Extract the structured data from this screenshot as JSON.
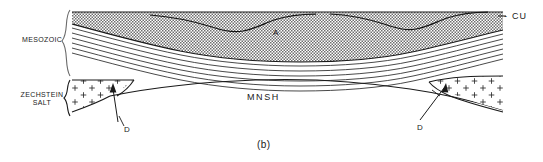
{
  "figure": {
    "caption": "(b)",
    "type": "geological-cross-section",
    "width": 543,
    "height": 162
  },
  "labels": {
    "mesozoic": "MESOZOIC",
    "zechstein_salt": "ZECHSTEIN\nSALT",
    "mnsh": "MNSH",
    "cu": "- CU",
    "horizon_a": "A",
    "diapir_left": "D",
    "diapir_right": "D"
  },
  "units": [
    {
      "name": "Chalk Group",
      "code": "CU",
      "pattern": "stipple",
      "position": "top"
    },
    {
      "name": "Mesozoic layered beds",
      "code": "MESOZOIC",
      "pattern": "parallel-lines",
      "position": "upper-middle"
    },
    {
      "name": "Zechstein Salt",
      "code": "ZECHSTEIN SALT",
      "pattern": "plus-signs",
      "position": "lower-flanks"
    },
    {
      "name": "Main Namurian Shale",
      "code": "MNSH",
      "pattern": "blank",
      "position": "bottom"
    }
  ],
  "annotations": [
    {
      "code": "A",
      "kind": "horizon-marker"
    },
    {
      "code": "CU",
      "kind": "top-surface-marker"
    },
    {
      "code": "D",
      "kind": "arrow-diapir-left"
    },
    {
      "code": "D",
      "kind": "arrow-diapir-right"
    }
  ],
  "colors": {
    "line": "#1a1a1a",
    "stipple": "#5a5a5a",
    "background": "#ffffff"
  }
}
